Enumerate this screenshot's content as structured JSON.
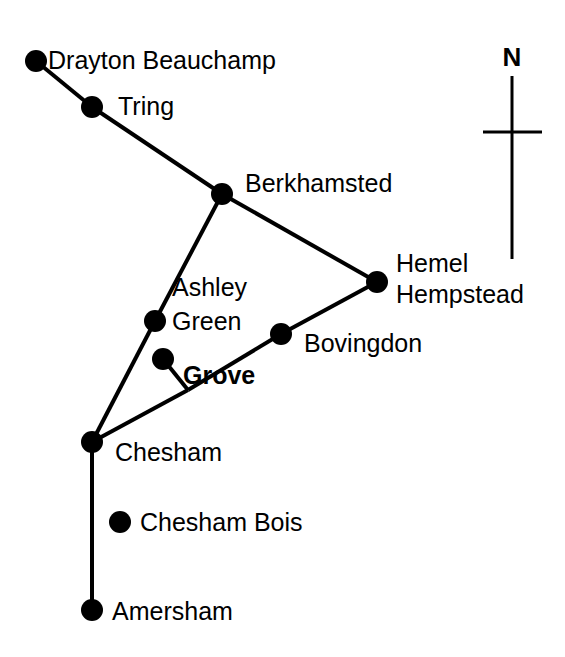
{
  "map": {
    "title": "Settlement network map",
    "background_color": "#ffffff",
    "ink_color": "#000000",
    "node_radius": 11,
    "edge_width": 4,
    "settlements": [
      {
        "id": "drayton-beauchamp",
        "label": "Drayton Beauchamp",
        "x": 36,
        "y": 61,
        "label_x": 48,
        "label_y": 69,
        "emphasis": "normal"
      },
      {
        "id": "tring",
        "label": "Tring",
        "x": 92,
        "y": 107,
        "label_x": 118,
        "label_y": 115,
        "emphasis": "normal"
      },
      {
        "id": "berkhamsted",
        "label": "Berkhamsted",
        "x": 222,
        "y": 194,
        "label_x": 245,
        "label_y": 192,
        "emphasis": "normal"
      },
      {
        "id": "hemel-hempstead",
        "label": "Hemel",
        "x": 377,
        "y": 282,
        "label_x": 396,
        "label_y": 272,
        "emphasis": "normal"
      },
      {
        "id": "ashley-green",
        "label": "Green",
        "x": 155,
        "y": 321,
        "label_x": 172,
        "label_y": 330,
        "emphasis": "normal"
      },
      {
        "id": "bovingdon",
        "label": "Bovingdon",
        "x": 281,
        "y": 334,
        "label_x": 304,
        "label_y": 352,
        "emphasis": "normal"
      },
      {
        "id": "grove",
        "label": "Grove",
        "x": 163,
        "y": 359,
        "label_x": 183,
        "label_y": 384,
        "emphasis": "bold"
      },
      {
        "id": "chesham",
        "label": "Chesham",
        "x": 92,
        "y": 442,
        "label_x": 115,
        "label_y": 461,
        "emphasis": "normal"
      },
      {
        "id": "chesham-bois",
        "label": "Chesham Bois",
        "x": 120,
        "y": 522,
        "label_x": 140,
        "label_y": 531,
        "emphasis": "normal"
      },
      {
        "id": "amersham",
        "label": "Amersham",
        "x": 92,
        "y": 610,
        "label_x": 112,
        "label_y": 620,
        "emphasis": "normal"
      }
    ],
    "extra_labels": [
      {
        "id": "ashley-green-line1",
        "label": "Ashley",
        "x": 172,
        "y": 296
      },
      {
        "id": "hemel-line2",
        "label": "Hempstead",
        "x": 396,
        "y": 303
      }
    ],
    "routes": [
      {
        "id": "drayton-tring",
        "from": "drayton-beauchamp",
        "to": "tring"
      },
      {
        "id": "tring-berkhamsted",
        "from": "tring",
        "to": "berkhamsted"
      },
      {
        "id": "berkhamsted-hemel",
        "from": "berkhamsted",
        "to": "hemel-hempstead"
      },
      {
        "id": "berkhamsted-ashley",
        "from": "berkhamsted",
        "to": "ashley-green"
      },
      {
        "id": "ashley-chesham",
        "from": "ashley-green",
        "to": "chesham"
      },
      {
        "id": "hemel-bovingdon",
        "from": "hemel-hempstead",
        "to": "bovingdon"
      },
      {
        "id": "bovingdon-junction",
        "from": "bovingdon",
        "to": "junction"
      },
      {
        "id": "grove-junction",
        "from": "grove",
        "to": "junction"
      },
      {
        "id": "junction-chesham",
        "from": "junction",
        "to": "chesham"
      },
      {
        "id": "chesham-amersham",
        "from": "chesham",
        "to": "amersham"
      }
    ],
    "junction": {
      "id": "junction",
      "x": 188,
      "y": 390
    },
    "compass": {
      "label": "N",
      "label_x": 512,
      "label_y": 66,
      "axis_x": 512,
      "axis_top": 76,
      "axis_bottom": 259,
      "bar_y": 132,
      "bar_left": 483,
      "bar_right": 542,
      "stroke_width": 3
    }
  }
}
